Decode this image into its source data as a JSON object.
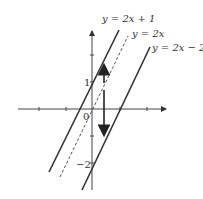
{
  "diagram": {
    "type": "coordinate-plane-lines",
    "lines": [
      {
        "label": "y = 2x + 1",
        "slope": 2,
        "intercept": 1,
        "style": "solid"
      },
      {
        "label": "y = 2x",
        "slope": 2,
        "intercept": 0,
        "style": "dashed"
      },
      {
        "label": "y = 2x − 2",
        "slope": 2,
        "intercept": -2,
        "style": "solid"
      }
    ],
    "tick_labels": {
      "one": "1",
      "origin": "0",
      "minus_two": "−2"
    },
    "arrows": [
      {
        "direction": "up",
        "meaning": "shift up by 1"
      },
      {
        "direction": "down",
        "meaning": "shift down by 2"
      }
    ]
  }
}
